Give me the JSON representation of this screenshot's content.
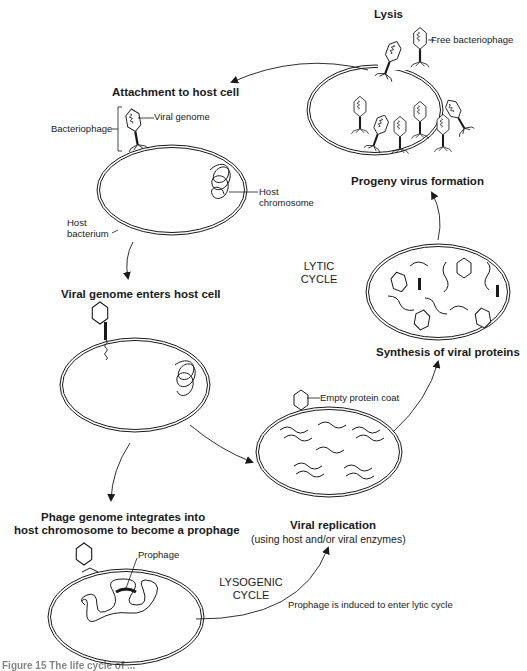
{
  "diagram": {
    "type": "flow-cycle",
    "topic": "Bacteriophage life cycle (lytic and lysogenic)",
    "stages": {
      "lysis": "Lysis",
      "attachment": "Attachment to host cell",
      "genome_enters": "Viral genome enters host cell",
      "integration_line1": "Phage genome integrates into",
      "integration_line2": "host chromosome to become a prophage",
      "replication": "Viral replication",
      "replication_note": "(using host and/or viral enzymes)",
      "synthesis": "Synthesis of viral proteins",
      "progeny": "Progeny virus formation"
    },
    "labels": {
      "free_bacteriophage": "Free bacteriophage",
      "viral_genome": "Viral genome",
      "bacteriophage": "Bacteriophage",
      "host_chromosome_1": "Host",
      "host_chromosome_2": "chromosome",
      "host_bacterium_1": "Host",
      "host_bacterium_2": "bacterium",
      "empty_protein_coat": "Empty protein coat",
      "prophage": "Prophage",
      "induction": "Prophage is induced to enter lytic cycle"
    },
    "cycles": {
      "lytic_1": "LYTIC",
      "lytic_2": "CYCLE",
      "lysogenic_1": "LYSOGENIC",
      "lysogenic_2": "CYCLE"
    },
    "caption": "Figure 15 The life cycle of ..."
  }
}
